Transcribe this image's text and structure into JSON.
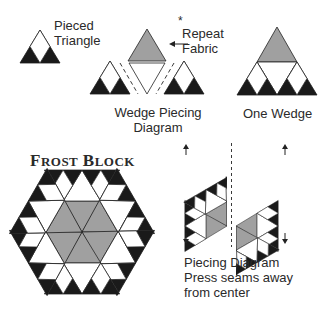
{
  "labels": {
    "pieced_triangle": [
      "Pieced",
      "Triangle"
    ],
    "repeat_fabric": [
      "Repeat",
      "Fabric"
    ],
    "repeat_asterisk": "*",
    "arrow_left": "←",
    "wedge_piecing": [
      "Wedge Piecing",
      "Diagram"
    ],
    "one_wedge": "One Wedge",
    "frost_block": {
      "f": "F",
      "rost": "ROST",
      "b": "B",
      "lock": "LOCK"
    },
    "piecing_diagram": [
      "Piecing Diagram",
      "Press seams away",
      "from center"
    ]
  },
  "colors": {
    "dark": "#1a1a1a",
    "gray": "#a0a0a0",
    "white": "#ffffff",
    "line": "#222222"
  }
}
